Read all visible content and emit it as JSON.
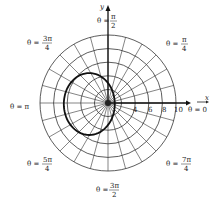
{
  "figure": {
    "type": "polar-graph",
    "center": {
      "x": 108,
      "y": 103
    },
    "px_per_unit": 6.8,
    "grid": {
      "circles_r": [
        2,
        4,
        6,
        8,
        10
      ],
      "ray_step_deg": 15
    },
    "axes": {
      "x_label": "x",
      "y_label": "y",
      "x_tick_labels": [
        "4",
        "6",
        "8",
        "10"
      ],
      "x_tick_values": [
        4,
        6,
        8,
        10
      ]
    },
    "angle_labels": [
      {
        "text_prefix": "θ = ",
        "num": "π",
        "den": "2",
        "coef": "",
        "pos": "top"
      },
      {
        "text_prefix": "θ = ",
        "num": "π",
        "den": "4",
        "coef": "",
        "pos": "top-right"
      },
      {
        "text_prefix": "θ = ",
        "num": "3π",
        "den": "4",
        "coef": "",
        "pos": "top-left"
      },
      {
        "text_prefix": "θ = ",
        "plain": "π",
        "pos": "left"
      },
      {
        "text_prefix": "θ = ",
        "plain": "0",
        "pos": "right"
      },
      {
        "text_prefix": "θ = ",
        "num": "5π",
        "den": "4",
        "pos": "bottom-left"
      },
      {
        "text_prefix": "θ = ",
        "num": "7π",
        "den": "4",
        "pos": "bottom-right"
      },
      {
        "text_prefix": "θ = ",
        "num": "3π",
        "den": "2",
        "pos": "bottom"
      }
    ],
    "curve": {
      "description": "bold closed loop curve on the left side of the pole",
      "approx_extent_units": {
        "left": -6.5,
        "right": 1,
        "top": 4.4,
        "bottom": -4.7
      }
    }
  },
  "labels": {
    "theta_pi_over_2": {
      "lhs": "θ =",
      "num": "π",
      "den": "2"
    },
    "theta_pi_over_4": {
      "lhs": "θ =",
      "num": "π",
      "den": "4"
    },
    "theta_3pi_over_4": {
      "lhs": "θ =",
      "num": "3π",
      "den": "4"
    },
    "theta_pi": "θ = π",
    "theta_0": "θ = 0",
    "theta_5pi_over_4": {
      "lhs": "θ =",
      "num": "5π",
      "den": "4"
    },
    "theta_7pi_over_4": {
      "lhs": "θ =",
      "num": "7π",
      "den": "4"
    },
    "theta_3pi_over_2": {
      "lhs": "θ =",
      "num": "3π",
      "den": "2"
    },
    "x_axis": "x",
    "y_axis": "y",
    "ticks": [
      "4",
      "6",
      "8",
      "10"
    ]
  }
}
